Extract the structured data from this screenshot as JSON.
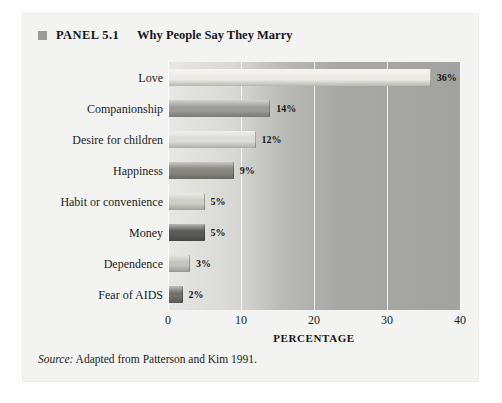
{
  "panel": {
    "marker_icon": "square-marker-icon",
    "label": "PANEL 5.1",
    "heading": "Why People Say They Marry"
  },
  "source": {
    "prefix": "Source:",
    "text": " Adapted from Patterson and Kim 1991."
  },
  "chart_data": {
    "type": "bar",
    "orientation": "horizontal",
    "title": "Why People Say They Marry",
    "xlabel": "PERCENTAGE",
    "ylabel": "",
    "xlim": [
      0,
      40
    ],
    "xticks": [
      "0",
      "10",
      "20",
      "30",
      "40"
    ],
    "grid": true,
    "legend": "none",
    "categories": [
      "Love",
      "Companionship",
      "Desire for children",
      "Happiness",
      "Habit or convenience",
      "Money",
      "Dependence",
      "Fear of AIDS"
    ],
    "values": [
      36,
      14,
      12,
      9,
      5,
      5,
      3,
      2
    ],
    "value_labels": [
      "36%",
      "14%",
      "12%",
      "9%",
      "5%",
      "5%",
      "3%",
      "2%"
    ],
    "bar_colors": [
      "#eceae4",
      "#9b9b97",
      "#dcdcd8",
      "#86867f",
      "#cfcfc9",
      "#5a5a56",
      "#c4c4bf",
      "#70706b"
    ]
  }
}
